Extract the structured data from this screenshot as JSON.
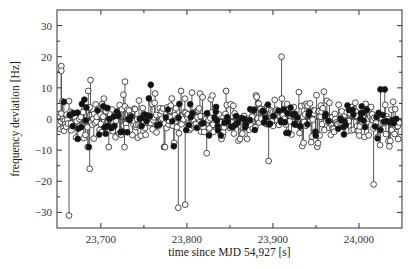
{
  "chart_data": {
    "type": "scatter",
    "subtype": "stem",
    "title": "",
    "xlabel": "time since MJD 54,927 [s]",
    "ylabel": "frequency deviation [Hz]",
    "xlim": [
      23649,
      24050
    ],
    "ylim": [
      -35,
      35
    ],
    "x_ticks": [
      23700,
      23800,
      23900,
      24000
    ],
    "x_tick_labels": [
      "23,700",
      "23,800",
      "23,900",
      "24,000"
    ],
    "x_minor_ticks": [
      23750,
      23850,
      23950
    ],
    "y_ticks": [
      -30,
      -20,
      -10,
      0,
      10,
      20,
      30
    ],
    "y_tick_labels": [
      "−30",
      "−20",
      "−10",
      "0",
      "10",
      "20",
      "30"
    ],
    "y_minor_ticks": [
      -25,
      -15,
      -5,
      5,
      15,
      25
    ],
    "grid": false,
    "legend": null,
    "series": [
      {
        "name": "open-circles",
        "marker": "open-circle",
        "typical_range": [
          -8,
          8
        ],
        "notable_points": [
          {
            "x": 23654,
            "y": 17
          },
          {
            "x": 23654,
            "y": 15.5
          },
          {
            "x": 23663,
            "y": -31
          },
          {
            "x": 23687,
            "y": -16
          },
          {
            "x": 23688,
            "y": 12.5
          },
          {
            "x": 23728,
            "y": 12
          },
          {
            "x": 23790,
            "y": -28.5
          },
          {
            "x": 23798,
            "y": -27.5
          },
          {
            "x": 23823,
            "y": -11
          },
          {
            "x": 23895,
            "y": -13.5
          },
          {
            "x": 23910,
            "y": 20
          },
          {
            "x": 24017,
            "y": -21
          }
        ]
      },
      {
        "name": "filled-circles",
        "marker": "filled-circle",
        "typical_range": [
          -6,
          6
        ],
        "notable_points": [
          {
            "x": 23657,
            "y": 5.5
          },
          {
            "x": 23758,
            "y": 11
          },
          {
            "x": 24025,
            "y": 9.5
          },
          {
            "x": 24030,
            "y": 9.5
          }
        ]
      }
    ],
    "dense_sampling": {
      "count": 520,
      "x_start": 23651,
      "x_end": 24047,
      "open_fraction": 0.72,
      "sigma_open": 3.6,
      "sigma_filled": 2.6,
      "seed": 54927
    }
  },
  "colors": {
    "axis": "#333333",
    "stem": "#444444",
    "marker_edge": "#222222",
    "marker_open_fill": "#ffffff",
    "marker_filled": "#111111"
  }
}
